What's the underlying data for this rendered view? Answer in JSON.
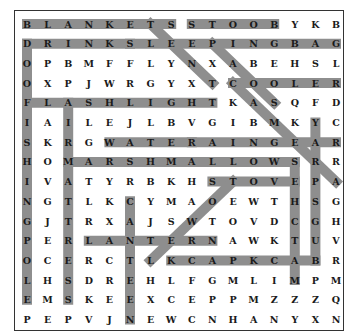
{
  "puzzle": {
    "type": "word-search",
    "rows": 16,
    "cols": 16,
    "grid": [
      "BLANKETSSTOOBYKB",
      "DRINKSLEEPINGBAG",
      "OPBMFFLYNXABEHSL",
      "OXPJWRGYXTCOOLER",
      "FLASHLIGHTKASQFD",
      "IAILEJLBVGIBMKYC",
      "SKRGWATERAINGEAR",
      "HOMARSHMALLOWSRR",
      "IVATYRBKHSTOVEPA",
      "NGTLKCYMAOEWTHSG",
      "GJTRXAJSWTOVDCGH",
      "PERLANTERNAWKTUV",
      "OCERCTLKCAPKCABR",
      "LHSDREHLFGMLIMPM",
      "EMSKEEXCEPPMZZZQ",
      "PEPVJNEWCNHANYXN"
    ],
    "band_color": "#8e8e8e",
    "found_words": [
      {
        "word": "BLANKETS",
        "start": [
          0,
          0
        ],
        "end": [
          0,
          7
        ]
      },
      {
        "word": "BOOTS",
        "start": [
          0,
          12
        ],
        "end": [
          0,
          8
        ]
      },
      {
        "word": "DRINKS",
        "start": [
          1,
          0
        ],
        "end": [
          1,
          5
        ]
      },
      {
        "word": "SLEEPINGBAG",
        "start": [
          1,
          5
        ],
        "end": [
          1,
          15
        ]
      },
      {
        "word": "COOLER",
        "start": [
          3,
          10
        ],
        "end": [
          3,
          15
        ]
      },
      {
        "word": "FLASHLIGHT",
        "start": [
          4,
          0
        ],
        "end": [
          4,
          9
        ]
      },
      {
        "word": "WATER",
        "start": [
          6,
          4
        ],
        "end": [
          6,
          8
        ]
      },
      {
        "word": "RAINGEAR",
        "start": [
          6,
          8
        ],
        "end": [
          6,
          15
        ]
      },
      {
        "word": "MARSHMALLOWS",
        "start": [
          7,
          2
        ],
        "end": [
          7,
          13
        ]
      },
      {
        "word": "STOVE",
        "start": [
          8,
          9
        ],
        "end": [
          8,
          13
        ]
      },
      {
        "word": "LANTERN",
        "start": [
          11,
          3
        ],
        "end": [
          11,
          9
        ]
      },
      {
        "word": "BACKPACK",
        "start": [
          12,
          14
        ],
        "end": [
          12,
          7
        ]
      },
      {
        "word": "FOOD",
        "start": [
          4,
          0
        ],
        "end": [
          1,
          0
        ]
      },
      {
        "word": "FISHINGPOLE",
        "start": [
          4,
          0
        ],
        "end": [
          14,
          0
        ]
      },
      {
        "word": "AIRMATTRESS",
        "start": [
          4,
          2
        ],
        "end": [
          14,
          2
        ]
      },
      {
        "word": "CANTEEN",
        "start": [
          9,
          5
        ],
        "end": [
          15,
          5
        ]
      },
      {
        "word": "MATCHES",
        "start": [
          13,
          13
        ],
        "end": [
          7,
          13
        ]
      },
      {
        "word": "BUGSPRAY",
        "start": [
          12,
          14
        ],
        "end": [
          5,
          14
        ]
      },
      {
        "word": "TENT",
        "start": [
          0,
          6
        ],
        "end": [
          3,
          9
        ]
      },
      {
        "word": "SOAP",
        "start": [
          4,
          12
        ],
        "end": [
          1,
          9
        ]
      },
      {
        "word": "CAMERA",
        "start": [
          3,
          10
        ],
        "end": [
          8,
          15
        ]
      },
      {
        "word": "TOWEL",
        "start": [
          8,
          10
        ],
        "end": [
          12,
          6
        ]
      }
    ]
  }
}
